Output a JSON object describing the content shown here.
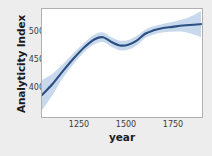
{
  "chart_data": {
    "type": "line",
    "title": "",
    "xlabel": "year",
    "ylabel": "Analyticity Index",
    "xlim": [
      1130,
      1890
    ],
    "ylim": [
      370,
      527
    ],
    "xticks": [
      1250,
      1500,
      1750
    ],
    "xtick_labels": [
      "1250",
      "1500",
      "1750"
    ],
    "yticks": [
      400,
      450,
      500
    ],
    "ytick_labels": [
      "400",
      "450",
      "500"
    ],
    "grid": false,
    "legend": null,
    "series": [
      {
        "name": "Analyticity Index (smoothed trend)",
        "type": "line",
        "color": "#2c4f82",
        "x": [
          1130,
          1180,
          1230,
          1280,
          1330,
          1380,
          1420,
          1460,
          1500,
          1540,
          1580,
          1620,
          1660,
          1700,
          1750,
          1800,
          1850,
          1885
        ],
        "y": [
          402,
          418,
          437,
          455,
          471,
          483,
          486,
          479,
          474,
          475,
          481,
          491,
          496,
          499,
          501,
          503,
          504,
          505
        ]
      },
      {
        "name": "confidence band (upper)",
        "type": "band-upper",
        "color": "#c5d6ec",
        "x": [
          1130,
          1180,
          1230,
          1280,
          1330,
          1380,
          1420,
          1460,
          1500,
          1540,
          1580,
          1620,
          1660,
          1700,
          1750,
          1800,
          1850,
          1885
        ],
        "y": [
          424,
          433,
          447,
          463,
          478,
          490,
          493,
          486,
          481,
          482,
          488,
          497,
          502,
          505,
          508,
          512,
          518,
          524
        ]
      },
      {
        "name": "confidence band (lower)",
        "type": "band-lower",
        "color": "#c5d6ec",
        "x": [
          1130,
          1180,
          1230,
          1280,
          1330,
          1380,
          1420,
          1460,
          1500,
          1540,
          1580,
          1620,
          1660,
          1700,
          1750,
          1800,
          1850,
          1885
        ],
        "y": [
          380,
          402,
          427,
          447,
          464,
          476,
          479,
          472,
          467,
          468,
          474,
          485,
          490,
          493,
          494,
          494,
          490,
          486
        ]
      }
    ],
    "colors": {
      "line": "#2c4f82",
      "band": "#c5d6ec",
      "panel_background": "#ffffff",
      "panel_border": "#b0b0b0",
      "figure_background": "#ededed",
      "text": "#1b1b1b"
    }
  },
  "axis": {
    "y_title": "Analyticity Index",
    "x_title": "year",
    "y_tick_0": "400",
    "y_tick_1": "450",
    "y_tick_2": "500",
    "x_tick_0": "1250",
    "x_tick_1": "1500",
    "x_tick_2": "1750"
  }
}
